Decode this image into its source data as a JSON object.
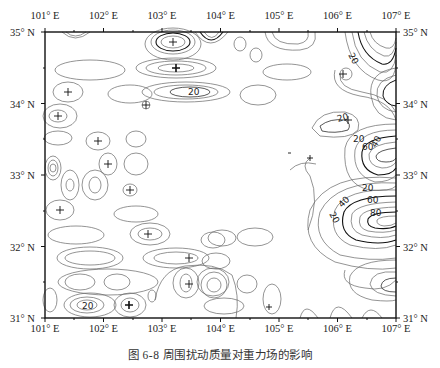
{
  "figure": {
    "caption": "图 6-8   周围扰动质量对重力场的影响",
    "x_axis": {
      "labels": [
        "101° E",
        "102° E",
        "103° E",
        "104° E",
        "105° E",
        "106° E",
        "107° E"
      ],
      "values": [
        101,
        102,
        103,
        104,
        105,
        106,
        107
      ]
    },
    "y_axis": {
      "labels": [
        "35° N",
        "34° N",
        "33° N",
        "32° N",
        "31° N"
      ],
      "values": [
        35,
        34,
        33,
        32,
        31
      ]
    },
    "contour_labels": [
      {
        "text": "20",
        "lon": 106.1,
        "lat": 34.7
      },
      {
        "text": "20",
        "lon": 103.6,
        "lat": 34.15
      },
      {
        "text": "20",
        "lon": 106.35,
        "lat": 33.8
      },
      {
        "text": "20",
        "lon": 106.55,
        "lat": 33.55
      },
      {
        "text": "40",
        "lon": 106.9,
        "lat": 33.4
      },
      {
        "text": "60",
        "lon": 106.6,
        "lat": 33.35
      },
      {
        "text": "20",
        "lon": 106.65,
        "lat": 32.85
      },
      {
        "text": "60",
        "lon": 106.7,
        "lat": 32.7
      },
      {
        "text": "40",
        "lon": 106.2,
        "lat": 32.65
      },
      {
        "text": "80",
        "lon": 106.75,
        "lat": 32.5
      },
      {
        "text": "20",
        "lon": 106.0,
        "lat": 32.2
      },
      {
        "text": "20",
        "lon": 101.7,
        "lat": 31.25
      }
    ],
    "contour_interval": 10,
    "bold_contour_interval": 20,
    "colors": {
      "line": "#555555",
      "bold": "#111111",
      "frame": "#111111",
      "text": "#222222"
    }
  }
}
